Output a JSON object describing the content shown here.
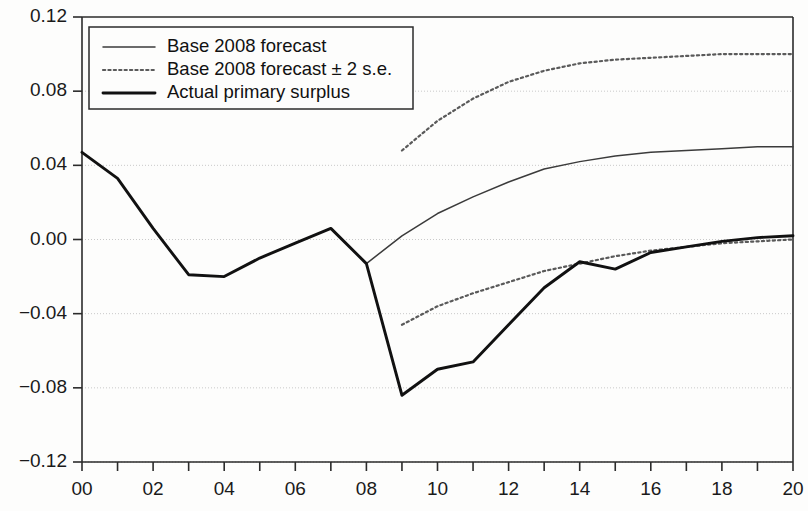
{
  "chart_data": {
    "type": "line",
    "title": "",
    "xlabel": "",
    "ylabel": "",
    "xlim": [
      0,
      20
    ],
    "ylim": [
      -0.12,
      0.12
    ],
    "grid": true,
    "legend_position": "top-left",
    "x_ticks_major": [
      "00",
      "02",
      "04",
      "06",
      "08",
      "10",
      "12",
      "14",
      "16",
      "18",
      "20"
    ],
    "x_ticks_all": [
      0,
      1,
      2,
      3,
      4,
      5,
      6,
      7,
      8,
      9,
      10,
      11,
      12,
      13,
      14,
      15,
      16,
      17,
      18,
      19,
      20
    ],
    "y_ticks": [
      "0.12",
      "0.08",
      "0.04",
      "0.00",
      "-0.04",
      "-0.08",
      "-0.12"
    ],
    "y_tick_values": [
      0.12,
      0.08,
      0.04,
      0.0,
      -0.04,
      -0.08,
      -0.12
    ],
    "series": [
      {
        "name": "Base 2008 forecast",
        "style": "solid-thin",
        "color": "#3b3b3b",
        "x": [
          8,
          9,
          10,
          11,
          12,
          13,
          14,
          15,
          16,
          17,
          18,
          19,
          20
        ],
        "values": [
          -0.013,
          0.002,
          0.014,
          0.023,
          0.031,
          0.038,
          0.042,
          0.045,
          0.047,
          0.048,
          0.049,
          0.05,
          0.05
        ]
      },
      {
        "name": "Base 2008 forecast ± 2 s.e.",
        "style": "dotted",
        "color": "#5a5a5a",
        "band": "upper",
        "x": [
          9,
          10,
          11,
          12,
          13,
          14,
          15,
          16,
          17,
          18,
          19,
          20
        ],
        "values": [
          0.048,
          0.064,
          0.076,
          0.085,
          0.091,
          0.095,
          0.097,
          0.098,
          0.099,
          0.1,
          0.1,
          0.1
        ]
      },
      {
        "name": "Base 2008 forecast ± 2 s.e.",
        "style": "dotted",
        "color": "#5a5a5a",
        "band": "lower",
        "x": [
          9,
          10,
          11,
          12,
          13,
          14,
          15,
          16,
          17,
          18,
          19,
          20
        ],
        "values": [
          -0.046,
          -0.036,
          -0.029,
          -0.023,
          -0.017,
          -0.013,
          -0.009,
          -0.006,
          -0.004,
          -0.002,
          -0.001,
          0.0
        ]
      },
      {
        "name": "Actual primary surplus",
        "style": "solid-thick",
        "color": "#111111",
        "x": [
          0,
          1,
          2,
          3,
          4,
          5,
          6,
          7,
          8,
          9,
          10,
          11,
          12,
          13,
          14,
          15,
          16,
          17,
          18,
          19,
          20
        ],
        "values": [
          0.047,
          0.033,
          0.006,
          -0.019,
          -0.02,
          -0.01,
          -0.002,
          0.006,
          -0.013,
          -0.084,
          -0.07,
          -0.066,
          -0.046,
          -0.026,
          -0.012,
          -0.016,
          -0.007,
          -0.004,
          -0.001,
          0.001,
          0.002
        ]
      }
    ],
    "legend": [
      {
        "label": "Base 2008 forecast",
        "style": "solid-thin"
      },
      {
        "label": "Base 2008 forecast ± 2 s.e.",
        "style": "dotted"
      },
      {
        "label": "Actual primary surplus",
        "style": "solid-thick"
      }
    ]
  },
  "colors": {
    "axis": "#2b2b2b",
    "grid": "#c9c9c9",
    "background": "#fdfdfc",
    "forecast": "#3b3b3b",
    "band": "#5a5a5a",
    "actual": "#111111"
  }
}
